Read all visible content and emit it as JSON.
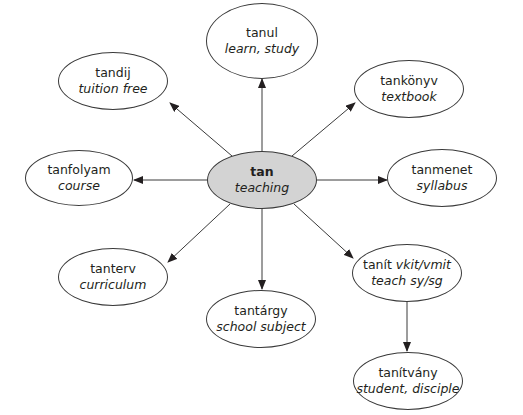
{
  "diagram": {
    "type": "word-family radial diagram",
    "colors": {
      "center_fill": "#d3d3d3",
      "node_fill": "#ffffff",
      "stroke": "#3a3a3a",
      "text": "#231f20"
    },
    "center": {
      "id": "tan",
      "term": "tan",
      "gloss": "teaching",
      "cx": 262,
      "cy": 180,
      "rx": 55,
      "ry": 29
    },
    "nodes": [
      {
        "id": "tanul",
        "term": "tanul",
        "gloss": "learn, study",
        "cx": 262,
        "cy": 41,
        "rx": 56,
        "ry": 38
      },
      {
        "id": "tandij",
        "term": "tandij",
        "gloss": "tuition free",
        "cx": 113,
        "cy": 81,
        "rx": 55,
        "ry": 29
      },
      {
        "id": "tankonyv",
        "term": "tankönyv",
        "gloss": "textbook",
        "cx": 409,
        "cy": 89,
        "rx": 55,
        "ry": 29
      },
      {
        "id": "tanfolyam",
        "term": "tanfolyam",
        "gloss": "course",
        "cx": 79,
        "cy": 178,
        "rx": 54,
        "ry": 28
      },
      {
        "id": "tanmenet",
        "term": "tanmenet",
        "gloss": "syllabus",
        "cx": 442,
        "cy": 178,
        "rx": 55,
        "ry": 29
      },
      {
        "id": "tanterv",
        "term": "tanterv",
        "gloss": "curriculum",
        "cx": 113,
        "cy": 277,
        "rx": 55,
        "ry": 29
      },
      {
        "id": "tantargy",
        "term": "tantárgy",
        "gloss": "school subject",
        "cx": 261,
        "cy": 319,
        "rx": 55,
        "ry": 29
      },
      {
        "id": "tanit",
        "term": "tanít",
        "term_italic": "vkit/vmit",
        "gloss": "teach sy/sg",
        "cx": 407,
        "cy": 273,
        "rx": 55,
        "ry": 29
      },
      {
        "id": "tanitvany",
        "term": "tanítvány",
        "gloss": "student, disciple",
        "cx": 408,
        "cy": 381,
        "rx": 55,
        "ry": 29
      }
    ],
    "edges": [
      {
        "from": "tan",
        "to": "tanul",
        "x1": 262,
        "y1": 151,
        "x2": 262,
        "y2": 79
      },
      {
        "from": "tan",
        "to": "tandij",
        "x1": 232,
        "y1": 156,
        "x2": 170,
        "y2": 103
      },
      {
        "from": "tan",
        "to": "tankonyv",
        "x1": 292,
        "y1": 156,
        "x2": 355,
        "y2": 103
      },
      {
        "from": "tan",
        "to": "tanfolyam",
        "x1": 207,
        "y1": 180,
        "x2": 134,
        "y2": 180
      },
      {
        "from": "tan",
        "to": "tanmenet",
        "x1": 317,
        "y1": 180,
        "x2": 387,
        "y2": 180
      },
      {
        "from": "tan",
        "to": "tanterv",
        "x1": 230,
        "y1": 204,
        "x2": 168,
        "y2": 262
      },
      {
        "from": "tan",
        "to": "tantargy",
        "x1": 262,
        "y1": 209,
        "x2": 262,
        "y2": 289
      },
      {
        "from": "tan",
        "to": "tanit",
        "x1": 294,
        "y1": 204,
        "x2": 353,
        "y2": 258
      },
      {
        "from": "tanit",
        "to": "tanitvany",
        "x1": 407,
        "y1": 302,
        "x2": 407,
        "y2": 351
      }
    ]
  }
}
